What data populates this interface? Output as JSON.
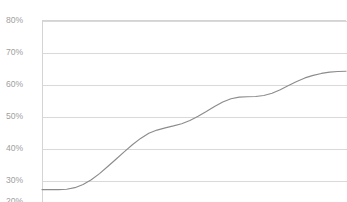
{
  "chart_data": {
    "type": "line",
    "title": "",
    "title_clipped": true,
    "subtitle": "",
    "xlabel": "",
    "ylabel": "",
    "ylim": [
      20,
      80
    ],
    "yticks": [
      80,
      70,
      60,
      50,
      40,
      30,
      20
    ],
    "ytick_labels": [
      "80%",
      "70%",
      "60%",
      "50%",
      "40%",
      "30%",
      "20%"
    ],
    "xticks": [],
    "xtick_labels": [],
    "grid": true,
    "grid_axis": "y",
    "legend": false,
    "legend_position": "none",
    "markers": false,
    "series": [
      {
        "name": "series-1",
        "color": "#8c8c8c",
        "values": [
          27.0,
          27.0,
          27.0,
          27.1,
          27.6,
          28.6,
          30.1,
          32.0,
          34.2,
          36.5,
          38.8,
          41.0,
          43.0,
          44.6,
          45.6,
          46.3,
          46.9,
          47.6,
          48.6,
          49.9,
          51.4,
          53.0,
          54.4,
          55.4,
          55.9,
          56.0,
          56.1,
          56.4,
          57.1,
          58.2,
          59.5,
          60.8,
          61.9,
          62.7,
          63.3,
          63.7,
          63.9,
          64.0
        ]
      }
    ]
  },
  "yaxis": {
    "labels": [
      {
        "text": "80%",
        "value": 80
      },
      {
        "text": "70%",
        "value": 70
      },
      {
        "text": "60%",
        "value": 60
      },
      {
        "text": "50%",
        "value": 50
      },
      {
        "text": "40%",
        "value": 40
      },
      {
        "text": "30%",
        "value": 30
      },
      {
        "text": "20%",
        "value": 20
      }
    ]
  },
  "colors": {
    "line": "#8c8c8c",
    "grid": "#d9d9d9",
    "border": "#d4d4d4",
    "tick_text": "#a0a0a0",
    "background": "#ffffff"
  }
}
